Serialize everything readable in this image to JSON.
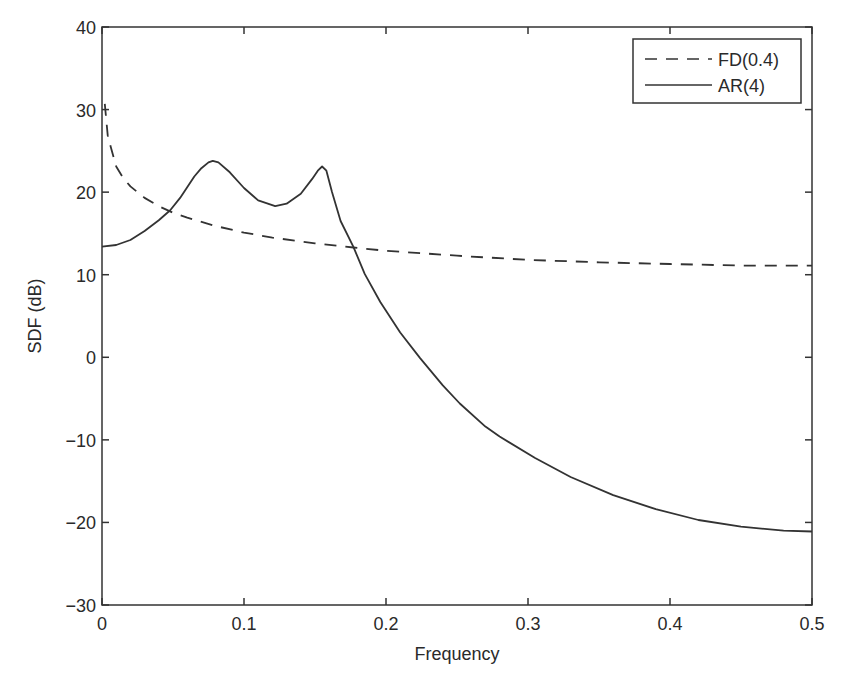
{
  "chart_data": {
    "type": "line",
    "title": "",
    "xlabel": "Frequency",
    "ylabel": "SDF (dB)",
    "xlim": [
      0,
      0.5
    ],
    "ylim": [
      -30,
      40
    ],
    "xticks": [
      0,
      0.1,
      0.2,
      0.3,
      0.4,
      0.5
    ],
    "xtick_labels": [
      "0",
      "0.1",
      "0.2",
      "0.3",
      "0.4",
      "0.5"
    ],
    "yticks": [
      -30,
      -20,
      -10,
      0,
      10,
      20,
      30,
      40
    ],
    "ytick_labels": [
      "−30",
      "−20",
      "−10",
      "0",
      "10",
      "20",
      "30",
      "40"
    ],
    "grid": false,
    "legend_position": "upper right",
    "series": [
      {
        "name": "FD(0.4)",
        "style": "dashed",
        "color": "#333333",
        "x": [
          0.002,
          0.004,
          0.006,
          0.01,
          0.015,
          0.02,
          0.03,
          0.04,
          0.05,
          0.06,
          0.08,
          0.1,
          0.12,
          0.15,
          0.177,
          0.2,
          0.25,
          0.3,
          0.35,
          0.4,
          0.45,
          0.5
        ],
        "y": [
          30.7,
          26.9,
          25.6,
          23.1,
          21.7,
          20.7,
          19.3,
          18.3,
          17.5,
          16.9,
          15.9,
          15.1,
          14.5,
          13.8,
          13.3,
          12.9,
          12.3,
          11.8,
          11.5,
          11.3,
          11.1,
          11.1
        ]
      },
      {
        "name": "AR(4)",
        "style": "solid",
        "color": "#333333",
        "x": [
          0,
          0.01,
          0.02,
          0.03,
          0.04,
          0.048,
          0.055,
          0.06,
          0.065,
          0.07,
          0.075,
          0.078,
          0.082,
          0.09,
          0.1,
          0.11,
          0.122,
          0.13,
          0.14,
          0.148,
          0.152,
          0.155,
          0.158,
          0.162,
          0.168,
          0.177,
          0.185,
          0.196,
          0.21,
          0.224,
          0.24,
          0.252,
          0.27,
          0.28,
          0.305,
          0.33,
          0.36,
          0.39,
          0.42,
          0.45,
          0.48,
          0.5
        ],
        "y": [
          13.4,
          13.6,
          14.2,
          15.3,
          16.6,
          17.8,
          19.3,
          20.6,
          21.9,
          22.9,
          23.6,
          23.8,
          23.6,
          22.4,
          20.5,
          19.0,
          18.3,
          18.6,
          19.8,
          21.6,
          22.6,
          23.1,
          22.6,
          20.0,
          16.5,
          13.4,
          10.1,
          6.7,
          3.0,
          -0.1,
          -3.4,
          -5.6,
          -8.4,
          -9.6,
          -12.2,
          -14.5,
          -16.7,
          -18.4,
          -19.7,
          -20.5,
          -21.0,
          -21.1
        ]
      }
    ]
  },
  "legend": {
    "items": [
      {
        "label": "FD(0.4)",
        "style": "dashed"
      },
      {
        "label": "AR(4)",
        "style": "solid"
      }
    ]
  },
  "colors": {
    "line": "#333333",
    "axes": "#333333",
    "background": "#ffffff"
  }
}
